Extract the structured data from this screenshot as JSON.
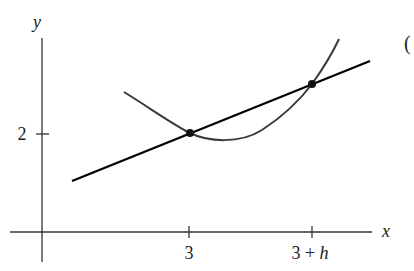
{
  "figure": {
    "axes": {
      "x_label": "x",
      "y_label": "y",
      "x_ticks": [
        {
          "label": "3",
          "px": 189
        },
        {
          "label": "3 + h",
          "px": 312
        }
      ],
      "y_ticks": [
        {
          "label": "2",
          "py": 134
        }
      ]
    },
    "panel_marker": "(",
    "curve": {
      "description": "parabola-like curve f(x)",
      "points_px": [
        [
          124,
          92
        ],
        [
          150,
          108
        ],
        [
          175,
          124
        ],
        [
          190,
          133
        ],
        [
          205,
          138
        ],
        [
          225,
          139
        ],
        [
          245,
          137
        ],
        [
          265,
          128
        ],
        [
          285,
          112
        ],
        [
          300,
          97
        ],
        [
          312,
          84
        ],
        [
          325,
          64
        ],
        [
          339,
          39
        ]
      ],
      "color": "#3a3a3a"
    },
    "secant_line": {
      "from_px": [
        72,
        181
      ],
      "to_px": [
        370,
        61
      ],
      "color": "#000000"
    },
    "marked_points": [
      {
        "name": "P",
        "x_label": "3",
        "px": [
          190,
          133
        ]
      },
      {
        "name": "Q",
        "x_label": "3 + h",
        "px": [
          312,
          84
        ]
      }
    ]
  },
  "chart_data": {
    "type": "line",
    "title": "",
    "xlabel": "x",
    "ylabel": "y",
    "x_tick_labels": [
      "3",
      "3 + h"
    ],
    "y_tick_labels": [
      "2"
    ],
    "series": [
      {
        "name": "curve f(x)",
        "kind": "curve"
      },
      {
        "name": "secant line through (3, f(3)) and (3+h, f(3+h))",
        "kind": "line"
      }
    ],
    "points": [
      {
        "x": "3",
        "y": 2
      },
      {
        "x": "3 + h",
        "y": "f(3+h)"
      }
    ],
    "grid": false,
    "legend": "none"
  }
}
